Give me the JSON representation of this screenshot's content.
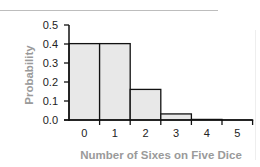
{
  "chart_data": {
    "type": "bar",
    "title": "",
    "xlabel": "Number of Sixes on Five Dice",
    "ylabel": "Probability",
    "categories": [
      "0",
      "1",
      "2",
      "3",
      "4",
      "5"
    ],
    "values": [
      0.402,
      0.402,
      0.161,
      0.032,
      0.003,
      0.0001
    ],
    "yticks": [
      "0.0",
      "0.1",
      "0.2",
      "0.3",
      "0.4",
      "0.5"
    ],
    "ylim": [
      0,
      0.5
    ],
    "grid": false,
    "legend": null,
    "bar_fill": "#e8e8e8",
    "bar_edge": "#111111"
  }
}
